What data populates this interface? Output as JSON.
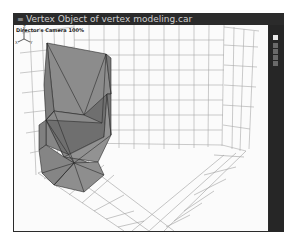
{
  "window": {
    "title": "Vertex Object of vertex modeling.car",
    "menu_icon": "≡"
  },
  "viewport": {
    "camera_label": "Director's Camera 100%",
    "axis_labels": {
      "z": "Z",
      "x": "X",
      "y": "Y"
    }
  },
  "sidebar": {
    "buttons": [
      {
        "name": "view-mode-1",
        "active": true
      },
      {
        "name": "view-mode-2",
        "active": false
      },
      {
        "name": "view-mode-3",
        "active": false
      },
      {
        "name": "view-mode-4",
        "active": false
      },
      {
        "name": "view-mode-5",
        "active": false
      }
    ]
  },
  "colors": {
    "frame": "#2b2b2b",
    "viewport_bg": "#fbfbfb",
    "grid": "#9a9a9a",
    "mesh_fill": "#8a8a8a",
    "mesh_dark": "#6f6f6f",
    "mesh_edge": "#2a2a2a"
  }
}
